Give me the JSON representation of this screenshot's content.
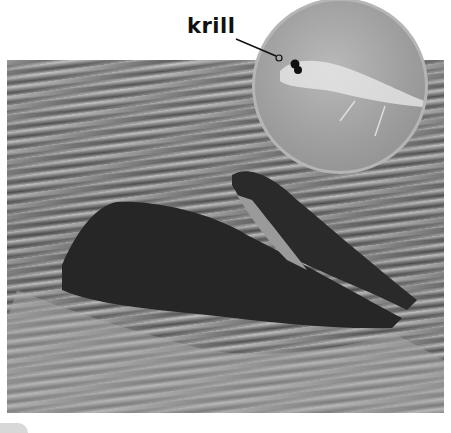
{
  "figure": {
    "main_image": "humpback whales lunge-feeding at the ocean surface",
    "inset_image": "close-up of a krill",
    "callout_label": "krill"
  },
  "colors": {
    "label_text": "#111111",
    "background": "#ffffff"
  }
}
